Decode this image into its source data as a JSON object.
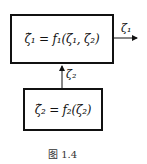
{
  "diagram": {
    "top_block": {
      "equation": "ζ̇₁ = f₁(ζ₁, ζ₂)"
    },
    "bottom_block": {
      "equation": "ζ̇₂ = f₂(ζ₂)"
    },
    "output_signal": {
      "label": "ζ₁"
    },
    "connecting_signal": {
      "label": "ζ₂"
    },
    "caption": "图 1.4"
  }
}
